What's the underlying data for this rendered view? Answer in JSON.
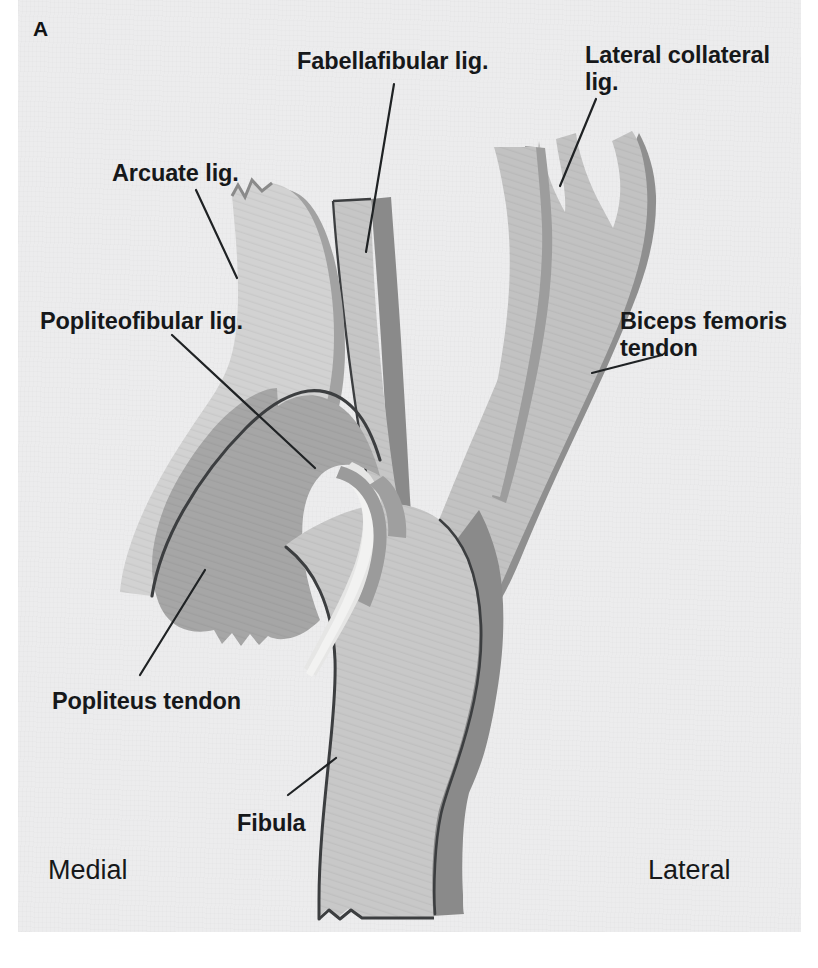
{
  "figure": {
    "panel_letter": "A",
    "view": "Posterolateral corner of the knee: fibular head ligament complex",
    "background_color": "#ececed",
    "ink_color": "#16181a"
  },
  "labels": [
    {
      "id": "arcuate",
      "text": "Arcuate lig.",
      "name": "label-arcuate-lig"
    },
    {
      "id": "popliteofibular",
      "text": "Popliteofibular lig.",
      "name": "label-popliteofibular-lig"
    },
    {
      "id": "popliteus",
      "text": "Popliteus tendon",
      "name": "label-popliteus-tendon"
    },
    {
      "id": "fibula",
      "text": "Fibula",
      "name": "label-fibula"
    },
    {
      "id": "fabellafibular",
      "text": "Fabellafibular lig.",
      "name": "label-fabellafibular-lig"
    },
    {
      "id": "lcl",
      "text": "Lateral collateral\nlig.",
      "name": "label-lateral-collateral-lig"
    },
    {
      "id": "biceps",
      "text": "Biceps femoris\ntendon",
      "name": "label-biceps-femoris-tendon"
    }
  ],
  "orientation": {
    "medial": "Medial",
    "lateral": "Lateral"
  },
  "colors": {
    "paper": "#ececed",
    "light_tissue": "#cdcdcd",
    "mid_tissue": "#bcbcbc",
    "dark_tissue": "#9d9d9d",
    "shadow_edge": "#8a8a8a",
    "outline": "#3c3e40",
    "highlight": "#e7e7e6",
    "text": "#16181a"
  }
}
